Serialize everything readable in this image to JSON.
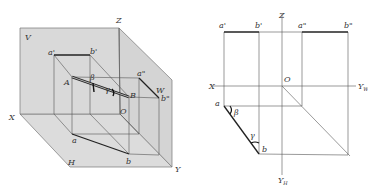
{
  "figure": {
    "colors": {
      "plane_fill": "#d9d9d9",
      "plane_fill_dark": "#cccccc",
      "line": "#555555",
      "bold_line": "#222222",
      "label": "#333333"
    }
  },
  "left_diagram": {
    "title": "3D pictorial view",
    "planes": {
      "V": "V",
      "W": "W",
      "H": "H"
    },
    "axes": {
      "X": "X",
      "Y": "Y",
      "Z": "Z",
      "O": "O"
    },
    "points": {
      "A": "A",
      "B": "B",
      "a_prime": "a'",
      "b_prime": "b'",
      "a_dprime": "a\"",
      "b_dprime": "b\"",
      "a": "a",
      "b": "b"
    },
    "angles": {
      "beta": "β",
      "gamma": "γ"
    }
  },
  "right_diagram": {
    "title": "Orthographic projection",
    "axes": {
      "X": "X",
      "Z": "Z",
      "O": "O",
      "YW": "Y",
      "YW_sub": "W",
      "YH": "Y",
      "YH_sub": "H"
    },
    "points": {
      "a_prime": "a'",
      "b_prime": "b'",
      "a_dprime": "a\"",
      "b_dprime": "b\"",
      "a": "a",
      "b": "b"
    },
    "angles": {
      "beta": "β",
      "gamma": "γ"
    }
  }
}
